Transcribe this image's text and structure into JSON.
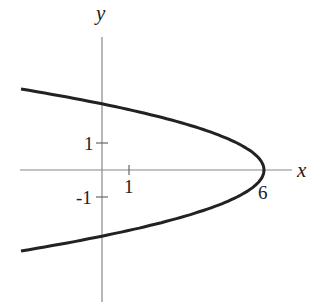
{
  "chart_data": {
    "type": "line",
    "title": "",
    "equation": "x = 6 - y^2",
    "xlabel": "x",
    "ylabel": "y",
    "x_ticks": [
      {
        "value": 1,
        "label": "1"
      },
      {
        "value": 6,
        "label": "6"
      }
    ],
    "y_ticks": [
      {
        "value": 1,
        "label": "1"
      },
      {
        "value": -1,
        "label": "-1"
      }
    ],
    "xlim": [
      -3,
      7
    ],
    "ylim": [
      -5,
      5
    ],
    "grid": false,
    "series": [
      {
        "name": "parabola",
        "x": [
          -3,
          0,
          2,
          5,
          6,
          5,
          2,
          0,
          -3
        ],
        "y": [
          3,
          2.449,
          2,
          1,
          0,
          -1,
          -2,
          -2.449,
          -3
        ]
      }
    ]
  },
  "labels": {
    "x": "x",
    "y": "y",
    "xt1": "1",
    "xt6": "6",
    "yt1": "1",
    "ytm1": "-1"
  }
}
